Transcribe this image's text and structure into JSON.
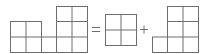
{
  "diagram": {
    "stroke_color": "#6e6e6e",
    "operators": {
      "equals": "=",
      "plus": "+"
    },
    "shapes": [
      {
        "name": "composite",
        "cells": 8
      },
      {
        "name": "square-2x2",
        "cells": 4
      },
      {
        "name": "l-shape",
        "cells": 7
      }
    ]
  }
}
